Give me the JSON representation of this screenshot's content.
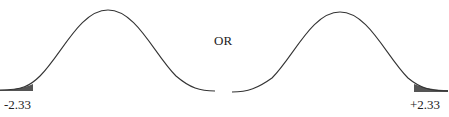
{
  "diagram": {
    "type": "normal-distribution-tails",
    "connector_label": "OR",
    "left_curve": {
      "shaded_tail": "left",
      "critical_value_label": "-2.33"
    },
    "right_curve": {
      "shaded_tail": "right",
      "critical_value_label": "+2.33"
    },
    "colors": {
      "curve": "#333333",
      "shade": "#555555",
      "text": "#222222"
    }
  }
}
